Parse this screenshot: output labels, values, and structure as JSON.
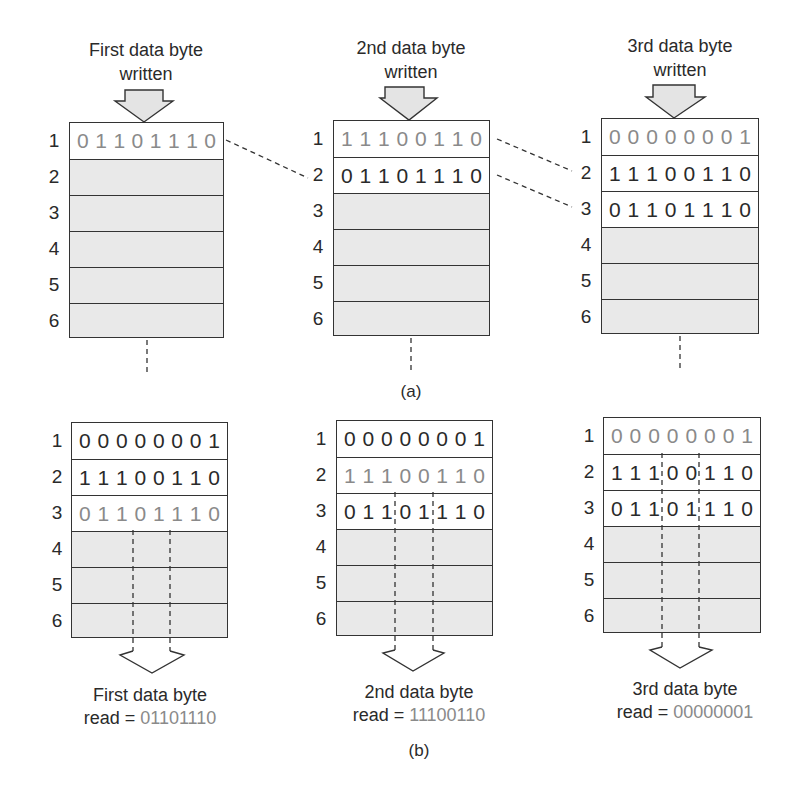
{
  "figure": {
    "part_a_label": "(a)",
    "part_b_label": "(b)",
    "row_numbers": [
      "1",
      "2",
      "3",
      "4",
      "5",
      "6"
    ]
  },
  "panel_a": {
    "columns": [
      {
        "title_line1": "First data byte",
        "title_line2": "written",
        "rows": [
          {
            "num": "1",
            "bits": [
              "0",
              "1",
              "1",
              "0",
              "1",
              "1",
              "1",
              "0"
            ],
            "style": "light"
          },
          {
            "num": "2",
            "bits": [],
            "style": "empty"
          },
          {
            "num": "3",
            "bits": [],
            "style": "empty"
          },
          {
            "num": "4",
            "bits": [],
            "style": "empty"
          },
          {
            "num": "5",
            "bits": [],
            "style": "empty"
          },
          {
            "num": "6",
            "bits": [],
            "style": "empty"
          }
        ]
      },
      {
        "title_line1": "2nd data byte",
        "title_line2": "written",
        "rows": [
          {
            "num": "1",
            "bits": [
              "1",
              "1",
              "1",
              "0",
              "0",
              "1",
              "1",
              "0"
            ],
            "style": "light"
          },
          {
            "num": "2",
            "bits": [
              "0",
              "1",
              "1",
              "0",
              "1",
              "1",
              "1",
              "0"
            ],
            "style": "dark"
          },
          {
            "num": "3",
            "bits": [],
            "style": "empty"
          },
          {
            "num": "4",
            "bits": [],
            "style": "empty"
          },
          {
            "num": "5",
            "bits": [],
            "style": "empty"
          },
          {
            "num": "6",
            "bits": [],
            "style": "empty"
          }
        ]
      },
      {
        "title_line1": "3rd data byte",
        "title_line2": "written",
        "rows": [
          {
            "num": "1",
            "bits": [
              "0",
              "0",
              "0",
              "0",
              "0",
              "0",
              "0",
              "1"
            ],
            "style": "light"
          },
          {
            "num": "2",
            "bits": [
              "1",
              "1",
              "1",
              "0",
              "0",
              "1",
              "1",
              "0"
            ],
            "style": "dark"
          },
          {
            "num": "3",
            "bits": [
              "0",
              "1",
              "1",
              "0",
              "1",
              "1",
              "1",
              "0"
            ],
            "style": "dark"
          },
          {
            "num": "4",
            "bits": [],
            "style": "empty"
          },
          {
            "num": "5",
            "bits": [],
            "style": "empty"
          },
          {
            "num": "6",
            "bits": [],
            "style": "empty"
          }
        ]
      }
    ]
  },
  "panel_b": {
    "columns": [
      {
        "read_line1": "First data byte",
        "read_prefix": "read = ",
        "read_value": "01101110",
        "rows": [
          {
            "num": "1",
            "bits": [
              "0",
              "0",
              "0",
              "0",
              "0",
              "0",
              "0",
              "1"
            ],
            "style": "dark"
          },
          {
            "num": "2",
            "bits": [
              "1",
              "1",
              "1",
              "0",
              "0",
              "1",
              "1",
              "0"
            ],
            "style": "dark"
          },
          {
            "num": "3",
            "bits": [
              "0",
              "1",
              "1",
              "0",
              "1",
              "1",
              "1",
              "0"
            ],
            "style": "light"
          },
          {
            "num": "4",
            "bits": [],
            "style": "empty"
          },
          {
            "num": "5",
            "bits": [],
            "style": "empty"
          },
          {
            "num": "6",
            "bits": [],
            "style": "empty"
          }
        ]
      },
      {
        "read_line1": "2nd data byte",
        "read_prefix": "read = ",
        "read_value": "11100110",
        "rows": [
          {
            "num": "1",
            "bits": [
              "0",
              "0",
              "0",
              "0",
              "0",
              "0",
              "0",
              "1"
            ],
            "style": "dark"
          },
          {
            "num": "2",
            "bits": [
              "1",
              "1",
              "1",
              "0",
              "0",
              "1",
              "1",
              "0"
            ],
            "style": "light"
          },
          {
            "num": "3",
            "bits": [
              "0",
              "1",
              "1",
              "0",
              "1",
              "1",
              "1",
              "0"
            ],
            "style": "dark"
          },
          {
            "num": "4",
            "bits": [],
            "style": "empty"
          },
          {
            "num": "5",
            "bits": [],
            "style": "empty"
          },
          {
            "num": "6",
            "bits": [],
            "style": "empty"
          }
        ]
      },
      {
        "read_line1": "3rd data byte",
        "read_prefix": "read = ",
        "read_value": "00000001",
        "rows": [
          {
            "num": "1",
            "bits": [
              "0",
              "0",
              "0",
              "0",
              "0",
              "0",
              "0",
              "1"
            ],
            "style": "light"
          },
          {
            "num": "2",
            "bits": [
              "1",
              "1",
              "1",
              "0",
              "0",
              "1",
              "1",
              "0"
            ],
            "style": "dark"
          },
          {
            "num": "3",
            "bits": [
              "0",
              "1",
              "1",
              "0",
              "1",
              "1",
              "1",
              "0"
            ],
            "style": "dark"
          },
          {
            "num": "4",
            "bits": [],
            "style": "empty"
          },
          {
            "num": "5",
            "bits": [],
            "style": "empty"
          },
          {
            "num": "6",
            "bits": [],
            "style": "empty"
          }
        ]
      }
    ]
  },
  "colors": {
    "cell_fill_empty": "#e9e9e9",
    "cell_fill_used": "#ffffff",
    "border": "#333333",
    "text_dark": "#2a2a2a",
    "text_light": "#8a8a8a"
  }
}
